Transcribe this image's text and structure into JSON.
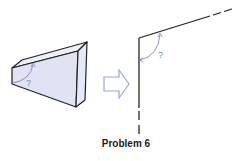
{
  "figure": {
    "caption": "Problem 6",
    "block_angle_label": "?",
    "edge_angle_label": "?",
    "arrow": "right-arrow-outline"
  },
  "colors": {
    "block_fill": "#dfe3f3",
    "block_side_fill": "#e8ebf7",
    "outline": "#222222",
    "angle_arc": "#7b86c4",
    "arrow_stroke": "#9aa6d6"
  }
}
